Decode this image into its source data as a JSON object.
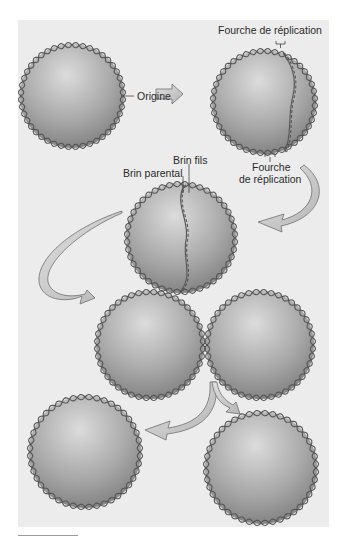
{
  "figure": {
    "labels": {
      "fork_top": "Fourche de réplication",
      "origin": "Origine",
      "daughter_strand": "Brin fils",
      "parent_strand": "Brin parental",
      "fork_bottom_line1": "Fourche",
      "fork_bottom_line2": "de réplication"
    },
    "colors": {
      "panel_bg": "#ececec",
      "cell_light": "#d2d2d2",
      "cell_dark": "#7a7a7a",
      "dna_strand": "#555555",
      "arrow_fill": "#c8c8c8",
      "arrow_stroke": "#6e6e6e"
    },
    "stages": [
      {
        "name": "origin-circle"
      },
      {
        "name": "replication-started"
      },
      {
        "name": "replication-advanced"
      },
      {
        "name": "two-joined-circles"
      },
      {
        "name": "separated-daughter-circles"
      }
    ]
  }
}
